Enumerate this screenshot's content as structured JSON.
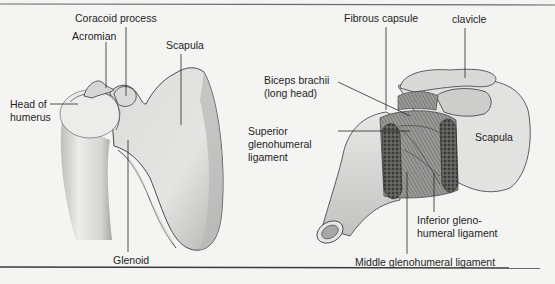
{
  "figure": {
    "left_panel": {
      "labels": {
        "coracoid_process": "Coracoid process",
        "acromian": "Acromian",
        "scapula": "Scapula",
        "head_of_humerus_1": "Head of",
        "head_of_humerus_2": "humerus",
        "glenoid": "Glenoid"
      }
    },
    "right_panel": {
      "labels": {
        "fibrous_capsule": "Fibrous capsule",
        "clavicle": "clavicle",
        "biceps_1": "Biceps brachii",
        "biceps_2": "(long head)",
        "superior_1": "Superior",
        "superior_2": "glenohumeral",
        "superior_3": "ligament",
        "scapula": "Scapula",
        "inferior_1": "Inferior gleno-",
        "inferior_2": "humeral ligament",
        "middle": "Middle glenohumeral ligament"
      }
    },
    "colors": {
      "bone_light": "#e6e6e4",
      "bone_mid": "#c9c9c7",
      "bone_dark": "#9a9a98",
      "outline": "#3a3a3a",
      "leader": "#2a2a2a",
      "background": "#f4f4f2",
      "rule": "#555555"
    }
  }
}
